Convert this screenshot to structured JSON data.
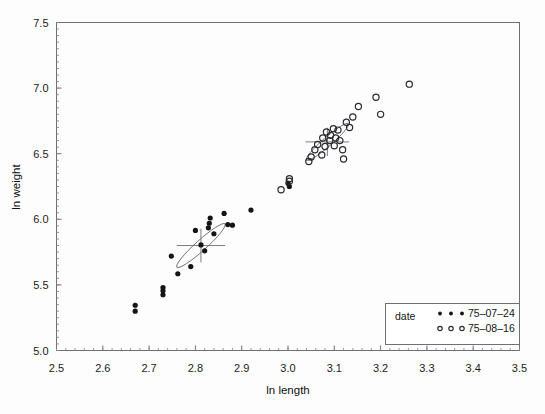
{
  "chart_data": {
    "type": "scatter",
    "title": "",
    "xlabel": "ln length",
    "ylabel": "ln weight",
    "xlim": [
      2.5,
      3.5
    ],
    "ylim": [
      5.0,
      7.5
    ],
    "xticks": [
      "2.5",
      "2.6",
      "2.7",
      "2.8",
      "2.9",
      "3.0",
      "3.1",
      "3.2",
      "3.3",
      "3.4",
      "3.5"
    ],
    "yticks": [
      "5.0",
      "5.5",
      "6.0",
      "6.5",
      "7.0",
      "7.5"
    ],
    "xtick_values": [
      2.5,
      2.6,
      2.7,
      2.8,
      2.9,
      3.0,
      3.1,
      3.2,
      3.3,
      3.4,
      3.5
    ],
    "ytick_values": [
      5.0,
      5.5,
      6.0,
      6.5,
      7.0,
      7.5
    ],
    "grid": false,
    "minor_ticks": true,
    "legend_position": "bottom-right",
    "legend_title": "date",
    "series": [
      {
        "name": "75-07-24",
        "marker": "filled-circle",
        "color": "#141414",
        "points": [
          [
            2.67,
            5.345
          ],
          [
            2.67,
            5.3
          ],
          [
            2.73,
            5.48
          ],
          [
            2.73,
            5.455
          ],
          [
            2.73,
            5.425
          ],
          [
            2.748,
            5.72
          ],
          [
            2.762,
            5.585
          ],
          [
            2.79,
            5.64
          ],
          [
            2.8,
            5.915
          ],
          [
            2.812,
            5.805
          ],
          [
            2.82,
            5.76
          ],
          [
            2.828,
            5.935
          ],
          [
            2.83,
            5.97
          ],
          [
            2.832,
            6.01
          ],
          [
            2.84,
            5.89
          ],
          [
            2.862,
            6.045
          ],
          [
            2.87,
            5.96
          ],
          [
            2.88,
            5.955
          ],
          [
            2.92,
            6.07
          ],
          [
            3.0,
            6.275
          ],
          [
            3.003,
            6.25
          ]
        ],
        "ellipse": {
          "cx": 2.812,
          "cy": 5.8,
          "rx": 0.07,
          "ry": 0.04,
          "angle_deg": -42
        },
        "centroid_cross": {
          "cx": 2.812,
          "cy": 5.8,
          "half_width_x": 0.052,
          "half_height_y": 0.128
        }
      },
      {
        "name": "75-08-16",
        "marker": "open-circle",
        "color": "#2b2b30",
        "points": [
          [
            2.985,
            6.225
          ],
          [
            3.003,
            6.31
          ],
          [
            3.003,
            6.29
          ],
          [
            3.045,
            6.44
          ],
          [
            3.05,
            6.475
          ],
          [
            3.058,
            6.53
          ],
          [
            3.064,
            6.57
          ],
          [
            3.073,
            6.49
          ],
          [
            3.075,
            6.62
          ],
          [
            3.08,
            6.555
          ],
          [
            3.083,
            6.665
          ],
          [
            3.09,
            6.6
          ],
          [
            3.092,
            6.64
          ],
          [
            3.098,
            6.69
          ],
          [
            3.1,
            6.56
          ],
          [
            3.103,
            6.62
          ],
          [
            3.108,
            6.68
          ],
          [
            3.112,
            6.6
          ],
          [
            3.118,
            6.53
          ],
          [
            3.12,
            6.46
          ],
          [
            3.126,
            6.74
          ],
          [
            3.133,
            6.7
          ],
          [
            3.14,
            6.78
          ],
          [
            3.152,
            6.86
          ],
          [
            3.19,
            6.93
          ],
          [
            3.2,
            6.8
          ],
          [
            3.262,
            7.03
          ]
        ],
        "ellipse": {
          "cx": 3.085,
          "cy": 6.59,
          "rx": 0.06,
          "ry": 0.034,
          "angle_deg": -41
        },
        "centroid_cross": {
          "cx": 3.085,
          "cy": 6.59,
          "half_width_x": 0.047,
          "half_height_y": 0.108
        }
      }
    ]
  },
  "legend": {
    "title": "date",
    "entries": [
      {
        "label": "75-07-24",
        "marker": "filled-circle"
      },
      {
        "label": "75-08-16",
        "marker": "open-circle"
      }
    ]
  },
  "colors": {
    "filled_marker": "#141414",
    "open_marker": "#2b2b30",
    "frame": "#6f6f74",
    "background": "#fdfdfe"
  }
}
